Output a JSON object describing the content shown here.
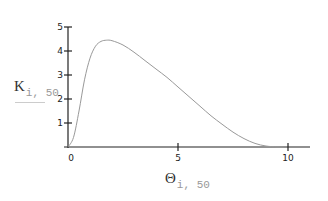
{
  "chart_data": {
    "type": "line",
    "title": "",
    "xlabel": "Θ",
    "xlabel_subscript": "i,50",
    "ylabel": "K",
    "ylabel_subscript": "i,50",
    "xlim": [
      0,
      10.5
    ],
    "ylim": [
      0,
      5
    ],
    "x_ticks": [
      "0",
      "5",
      "10"
    ],
    "y_ticks": [
      "1",
      "2",
      "3",
      "4",
      "5"
    ],
    "grid": false,
    "legend": null,
    "series": [
      {
        "name": "K_i,50",
        "x": [
          0,
          0.25,
          0.5,
          0.75,
          1.0,
          1.25,
          1.5,
          1.75,
          2.0,
          2.5,
          3.0,
          3.5,
          4.0,
          4.5,
          5.0,
          5.5,
          6.0,
          6.5,
          7.0,
          7.5,
          8.0,
          8.5,
          9.0,
          9.5,
          9.8
        ],
        "values": [
          0,
          0.4,
          1.5,
          2.8,
          3.7,
          4.2,
          4.4,
          4.45,
          4.43,
          4.25,
          3.95,
          3.6,
          3.25,
          2.9,
          2.5,
          2.1,
          1.7,
          1.3,
          0.95,
          0.62,
          0.35,
          0.15,
          0.04,
          0.005,
          0
        ]
      }
    ]
  },
  "labels": {
    "y_main": "K",
    "y_sub": "i, 50",
    "x_main": "Θ",
    "x_sub": "i, 50"
  }
}
